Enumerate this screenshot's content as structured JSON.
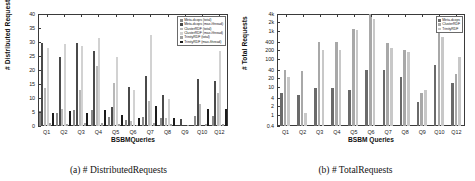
{
  "figure": {
    "panels": [
      {
        "caption": "(a) # DistributedRequests",
        "ylabel": "# Distributed Requests",
        "xlabel": "BSBMQueries"
      },
      {
        "caption": "(b) # TotalRequests",
        "ylabel": "# Total Requests",
        "xlabel": "BSBM Queries"
      }
    ]
  },
  "colors": {
    "meta_total": "#8a8a8a",
    "meta_max": "#4a4a4a",
    "cluster_total": "#b8b8b8",
    "cluster_max": "#d2d2d2",
    "trinity_total": "#a0a0a0",
    "trinity_max": "#1c1c1c",
    "axis": "#3a3a3a",
    "text": "#1a1a1a"
  },
  "chart_data": [
    {
      "type": "bar",
      "title": "(a) # DistributedRequests",
      "xlabel": "BSBMQueries",
      "ylabel": "# Distributed Requests",
      "ylim": [
        0,
        40
      ],
      "yticks": [
        0,
        5,
        10,
        15,
        20,
        25,
        30,
        35,
        40
      ],
      "ytick_labels": [
        "0",
        "5",
        "10",
        "15",
        "20",
        "25",
        "30",
        "35",
        "40"
      ],
      "grid": false,
      "legend_position": "top-right",
      "categories": [
        "Q1",
        "Q2",
        "Q3",
        "Q4",
        "Q5",
        "Q6",
        "Q7",
        "Q8",
        "Q9",
        "Q10",
        "Q12"
      ],
      "series": [
        {
          "name": "Meta-dcops (total)",
          "color": "#8a8a8a",
          "values": [
            5.3,
            4.8,
            5.6,
            5.8,
            3.2,
            2.0,
            3.3,
            2.8,
            0.0,
            3.6,
            3.4
          ]
        },
        {
          "name": "Meta-dcops (max./thread)",
          "color": "#4a4a4a",
          "values": [
            29.5,
            24.7,
            29.6,
            26.7,
            6.7,
            13.9,
            17.8,
            11.0,
            2.4,
            16.8,
            16.0
          ]
        },
        {
          "name": "ClusterRDF (total)",
          "color": "#b8b8b8",
          "values": [
            13.6,
            6.1,
            12.9,
            21.6,
            15.5,
            1.9,
            8.9,
            3.0,
            0.0,
            8.0,
            11.9
          ]
        },
        {
          "name": "ClusterRDF (max./thread)",
          "color": "#d2d2d2",
          "values": [
            27.7,
            29.4,
            28.5,
            31.5,
            24.8,
            12.8,
            32.6,
            9.6,
            0.0,
            0.0,
            26.8
          ]
        },
        {
          "name": "TrinityRDF (total)",
          "color": "#a0a0a0",
          "values": [
            0.9,
            0.8,
            0.9,
            0.9,
            0.7,
            0.5,
            1.0,
            0.6,
            0.3,
            0.8,
            0.8
          ]
        },
        {
          "name": "TrinityRDF (max./thread)",
          "color": "#1c1c1c",
          "values": [
            4.6,
            5.5,
            4.8,
            5.8,
            3.8,
            2.8,
            7.0,
            2.8,
            0.0,
            6.0,
            6.1
          ]
        }
      ]
    },
    {
      "type": "bar",
      "title": "(b) # TotalRequests",
      "xlabel": "BSBM Queries",
      "ylabel": "# Total Requests",
      "yscale": "log",
      "ylim": [
        0.4,
        4000
      ],
      "yticks": [
        0.4,
        1,
        2,
        4,
        10,
        20,
        40,
        100,
        200,
        400,
        1000,
        2000,
        4000
      ],
      "ytick_labels": [
        "0.4",
        "1",
        "2",
        "4",
        "10",
        "20",
        "40",
        "100",
        "200",
        "400",
        "1k",
        "2k",
        "4k"
      ],
      "grid": false,
      "legend_position": "top-right",
      "categories": [
        "Q1",
        "Q2",
        "Q3",
        "Q4",
        "Q5",
        "Q6",
        "Q7",
        "Q8",
        "Q9",
        "Q10",
        "Q12"
      ],
      "series": [
        {
          "name": "Meta-dcops",
          "color": "#6a6a6a",
          "values": [
            6,
            5,
            9,
            9,
            8,
            40,
            40,
            22,
            3,
            60,
            14
          ]
        },
        {
          "name": "ClusterRDF",
          "color": "#a8a8a8",
          "values": [
            40,
            38,
            400,
            400,
            1200,
            4000,
            380,
            200,
            6,
            900,
            30
          ]
        },
        {
          "name": "TrinityRDF",
          "color": "#c8c8c8",
          "values": [
            22,
            1.2,
            200,
            200,
            1100,
            2600,
            250,
            170,
            8,
            600,
            120
          ]
        }
      ]
    }
  ],
  "legends": {
    "left": [
      {
        "label": "Meta-dcops (total)",
        "color": "#8a8a8a"
      },
      {
        "label": "Meta-dcops (max./thread)",
        "color": "#4a4a4a"
      },
      {
        "label": "ClusterRDF (total)",
        "color": "#b8b8b8"
      },
      {
        "label": "ClusterRDF (max./thread)",
        "color": "#d2d2d2"
      },
      {
        "label": "TrinityRDF (total)",
        "color": "#a0a0a0"
      },
      {
        "label": "TrinityRDF (max./thread)",
        "color": "#1c1c1c"
      }
    ],
    "right": [
      {
        "label": "Meta-dcops",
        "color": "#6a6a6a"
      },
      {
        "label": "ClusterRDF",
        "color": "#a8a8a8"
      },
      {
        "label": "TrinityRDF",
        "color": "#c8c8c8"
      }
    ]
  }
}
